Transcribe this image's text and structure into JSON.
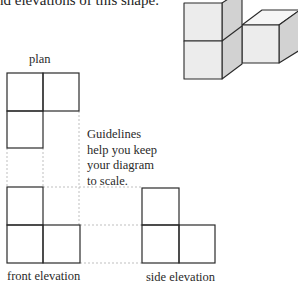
{
  "title": "nd elevations of this shape.",
  "plan": {
    "label": "plan"
  },
  "guidelines": {
    "note_lines": [
      "Guidelines",
      "help you keep",
      "your diagram",
      "to scale."
    ]
  },
  "front_elevation": {
    "label": "front elevation"
  },
  "side_elevation": {
    "label": "side elevation"
  },
  "colors": {
    "line": "#2a2a2a",
    "guide": "#b8b8b8",
    "cube_front": "#ececec",
    "cube_side": "#d2d2d2",
    "cube_top": "#f6f6f6"
  }
}
